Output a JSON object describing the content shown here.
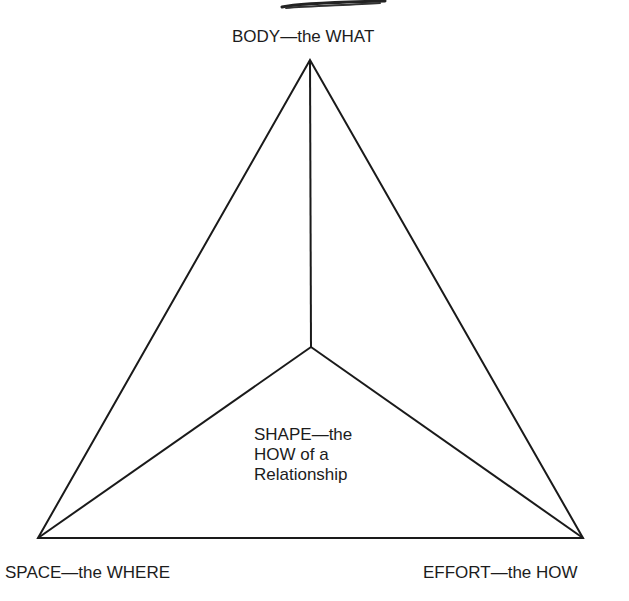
{
  "diagram": {
    "type": "triangle-with-center-point",
    "vertices": {
      "top": {
        "label": "BODY—the WHAT",
        "x": 310,
        "y": 60
      },
      "bottom_left": {
        "label": "SPACE—the WHERE",
        "x": 38,
        "y": 538
      },
      "bottom_right": {
        "label": "EFFORT—the HOW",
        "x": 583,
        "y": 538
      }
    },
    "center": {
      "x": 311,
      "y": 347,
      "label_lines": [
        "SHAPE—the",
        "HOW of a",
        "Relationship"
      ]
    },
    "line_color": "#1a1a1a",
    "line_width": 2
  }
}
